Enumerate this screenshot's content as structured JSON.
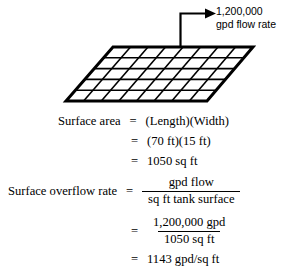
{
  "diagram": {
    "name": "settling-tank-surface-plane",
    "flow_label_line1": "1,200,000",
    "flow_label_line2": "gpd flow rate",
    "grid": {
      "columns": 8,
      "rows": 5,
      "line_color": "#000000",
      "fill_color": "#ffffff",
      "outline_width_px": 3,
      "inner_line_width_px": 1.6
    },
    "arrow": {
      "name": "flow-rate-arrow",
      "color": "#000000"
    }
  },
  "equations": {
    "surface_area": {
      "label": "Surface area",
      "eq": "=",
      "line1_rhs": "(Length)(Width)",
      "line2_rhs": "(70 ft)(15 ft)",
      "line3_rhs": "1050 sq ft"
    },
    "surface_overflow_rate": {
      "label": "Surface overflow rate",
      "eq": "=",
      "frac1_numerator": "gpd flow",
      "frac1_denominator": "sq ft tank surface",
      "frac2_numerator": "1,200,000 gpd",
      "frac2_denominator": "1050 sq ft",
      "result": "1143 gpd/sq ft"
    }
  },
  "colors": {
    "ink": "#000000",
    "paper": "#ffffff"
  }
}
